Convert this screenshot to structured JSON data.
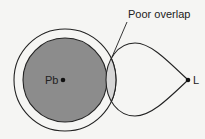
{
  "diagram": {
    "annotation": "Poor overlap",
    "atoms": [
      {
        "symbol": "Pb",
        "role": "large metal atom"
      },
      {
        "symbol": "L",
        "role": "ligand"
      }
    ]
  },
  "colors": {
    "background": "#f5f5f3",
    "pb_orbital": "#8c8c8c",
    "overlap_region": "#d6d6d6",
    "stroke": "#222222"
  }
}
